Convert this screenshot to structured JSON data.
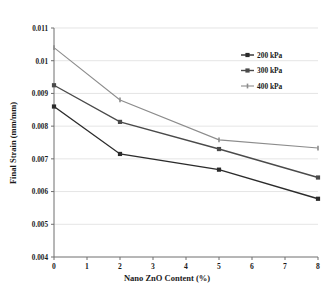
{
  "chart_data": {
    "type": "line",
    "title": "",
    "xlabel": "Nano ZnO Content (%)",
    "ylabel": "Final Strain (mm/mm)",
    "x": [
      0,
      2,
      5,
      8
    ],
    "xlim": [
      0,
      8
    ],
    "ylim": [
      0.004,
      0.011
    ],
    "xticks": [
      "0",
      "1",
      "2",
      "3",
      "4",
      "5",
      "6",
      "7",
      "8"
    ],
    "yticks": [
      "0.004",
      "0.005",
      "0.006",
      "0.007",
      "0.008",
      "0.009",
      "0.01",
      "0.011"
    ],
    "grid": true,
    "legend_position": "top-right",
    "series": [
      {
        "name": "200 kPa",
        "values": [
          0.0086,
          0.00715,
          0.00667,
          0.00578
        ],
        "color": "#2b2b2b",
        "marker": "square"
      },
      {
        "name": "300 kPa",
        "values": [
          0.00925,
          0.00813,
          0.0073,
          0.00643
        ],
        "color": "#4a4a4a",
        "marker": "square"
      },
      {
        "name": "400 kPa",
        "values": [
          0.0104,
          0.0088,
          0.00758,
          0.00733
        ],
        "color": "#8c8c8c",
        "marker": "tick"
      }
    ]
  },
  "legend": {
    "items": [
      {
        "label": "200 kPa"
      },
      {
        "label": "300 kPa"
      },
      {
        "label": "400 kPa"
      }
    ]
  },
  "axes": {
    "x_title": "Nano ZnO Content (%)",
    "y_title": "Final Strain (mm/mm)",
    "y_tick_0": "0.011",
    "y_tick_1": "0.01",
    "y_tick_2": "0.009",
    "y_tick_3": "0.008",
    "y_tick_4": "0.007",
    "y_tick_5": "0.006",
    "y_tick_6": "0.005",
    "y_tick_7": "0.004",
    "x_tick_0": "0",
    "x_tick_1": "1",
    "x_tick_2": "2",
    "x_tick_3": "3",
    "x_tick_4": "4",
    "x_tick_5": "5",
    "x_tick_6": "6",
    "x_tick_7": "7",
    "x_tick_8": "8"
  },
  "colors": {
    "axis": "#6e6e6e",
    "grid": "#d9d9d9",
    "series_200": "#2b2b2b",
    "series_300": "#4a4a4a",
    "series_400": "#8c8c8c"
  }
}
